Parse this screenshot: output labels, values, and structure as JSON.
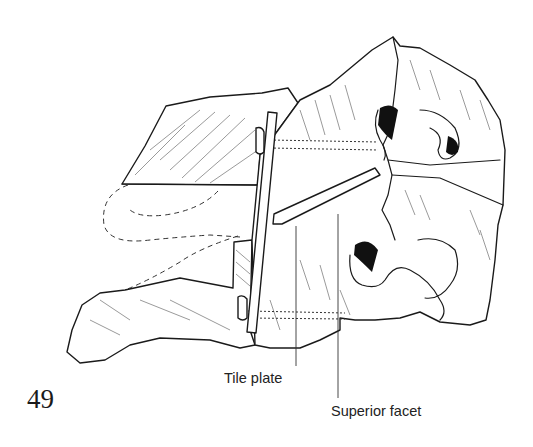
{
  "figure": {
    "number": "49",
    "labels": [
      {
        "text": "Tile plate",
        "target": "tile-plate"
      },
      {
        "text": "Superior facet",
        "target": "superior-facet"
      }
    ]
  }
}
